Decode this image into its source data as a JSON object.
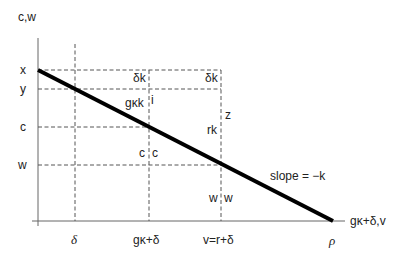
{
  "diagram": {
    "y_axis_label": "c,w",
    "x_axis_label": "gκ+δ,v",
    "y_levels": [
      "x",
      "y",
      "c",
      "w"
    ],
    "x_ticks": [
      "δ",
      "gκ+δ",
      "v=r+δ",
      "ρ"
    ],
    "annotations": {
      "delta_k_left": "δk",
      "delta_k_right": "δk",
      "gk_k": "gκk",
      "i": "i",
      "z": "z",
      "rk": "rk",
      "c_left": "c",
      "c_right": "c",
      "w_left": "w",
      "w_right": "w",
      "slope": "slope = −k"
    }
  }
}
